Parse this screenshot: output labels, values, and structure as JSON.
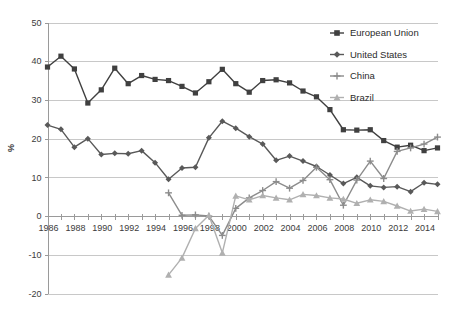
{
  "chart_data": {
    "type": "line",
    "title": "",
    "xlabel": "",
    "ylabel": "%",
    "ylim": [
      -20,
      50
    ],
    "ytick_step": 10,
    "yticks": [
      50,
      40,
      30,
      20,
      10,
      0,
      -10,
      -20
    ],
    "ytick_labels": [
      "50",
      "40",
      "30",
      "20",
      "10",
      "0",
      "-10",
      "-20"
    ],
    "xlim": [
      1986,
      2015
    ],
    "xticks": [
      1986,
      1988,
      1990,
      1992,
      1994,
      1996,
      1998,
      2000,
      2002,
      2004,
      2006,
      2008,
      2010,
      2012,
      2014
    ],
    "xtick_labels": [
      "1986",
      "1988",
      "1990",
      "1992",
      "1994",
      "1996",
      "1998",
      "2000",
      "2002",
      "2004",
      "2006",
      "2008",
      "2010",
      "2012",
      "2014"
    ],
    "x_minor_ticks": [
      1986,
      1987,
      1988,
      1989,
      1990,
      1991,
      1992,
      1993,
      1994,
      1995,
      1996,
      1997,
      1998,
      1999,
      2000,
      2001,
      2002,
      2003,
      2004,
      2005,
      2006,
      2007,
      2008,
      2009,
      2010,
      2011,
      2012,
      2013,
      2014,
      2015
    ],
    "grid": true,
    "grid_axis": "y",
    "legend_position": "top-right",
    "series": [
      {
        "name": "European Union",
        "color": "#404040",
        "marker": "square",
        "x": [
          1986,
          1987,
          1988,
          1989,
          1990,
          1991,
          1992,
          1993,
          1994,
          1995,
          1996,
          1997,
          1998,
          1999,
          2000,
          2001,
          2002,
          2003,
          2004,
          2005,
          2006,
          2007,
          2008,
          2009,
          2010,
          2011,
          2012,
          2013,
          2014,
          2015
        ],
        "values": [
          38.5,
          41.3,
          38.0,
          29.2,
          32.6,
          38.2,
          34.2,
          36.3,
          35.3,
          35.0,
          33.5,
          31.8,
          34.7,
          37.9,
          34.2,
          32.0,
          35.0,
          35.2,
          34.4,
          32.3,
          30.8,
          27.5,
          22.3,
          22.2,
          22.3,
          19.5,
          17.8,
          18.3,
          16.9,
          17.6
        ]
      },
      {
        "name": "United States",
        "color": "#595959",
        "marker": "diamond",
        "x": [
          1986,
          1987,
          1988,
          1989,
          1990,
          1991,
          1992,
          1993,
          1994,
          1995,
          1996,
          1997,
          1998,
          1999,
          2000,
          2001,
          2002,
          2003,
          2004,
          2005,
          2006,
          2007,
          2008,
          2009,
          2010,
          2011,
          2012,
          2013,
          2014,
          2015
        ],
        "values": [
          23.5,
          22.4,
          17.8,
          20.0,
          15.9,
          16.2,
          16.1,
          16.9,
          13.8,
          9.5,
          12.4,
          12.6,
          20.2,
          24.5,
          22.7,
          20.5,
          18.6,
          14.4,
          15.5,
          14.2,
          12.8,
          10.6,
          8.4,
          10.0,
          7.8,
          7.4,
          7.6,
          6.3,
          8.6,
          8.2
        ]
      },
      {
        "name": "China",
        "color": "#8c8c8c",
        "marker": "plus",
        "x": [
          1995,
          1996,
          1997,
          1998,
          1999,
          2000,
          2001,
          2002,
          2003,
          2004,
          2005,
          2006,
          2007,
          2008,
          2009,
          2010,
          2011,
          2012,
          2013,
          2014,
          2015
        ],
        "values": [
          6.0,
          0.2,
          0.3,
          0.0,
          -5.0,
          2.0,
          4.7,
          6.6,
          8.9,
          7.2,
          9.2,
          12.6,
          9.4,
          2.8,
          9.3,
          14.2,
          9.7,
          16.7,
          17.6,
          18.6,
          20.4
        ]
      },
      {
        "name": "Brazil",
        "color": "#b0b0b0",
        "marker": "triangle",
        "x": [
          1995,
          1996,
          1997,
          1998,
          1999,
          2000,
          2001,
          2002,
          2003,
          2004,
          2005,
          2006,
          2007,
          2008,
          2009,
          2010,
          2011,
          2012,
          2013,
          2014,
          2015
        ],
        "values": [
          -15.2,
          -10.8,
          -3.2,
          0.2,
          -9.5,
          5.2,
          4.2,
          5.3,
          4.7,
          4.2,
          5.6,
          5.3,
          4.7,
          4.4,
          3.3,
          4.2,
          3.8,
          2.6,
          1.3,
          1.8,
          1.2
        ]
      }
    ]
  },
  "legend": {
    "items": [
      {
        "label": "European Union"
      },
      {
        "label": "United States"
      },
      {
        "label": "China"
      },
      {
        "label": "Brazil"
      }
    ]
  },
  "axis": {
    "y_title": "%"
  }
}
